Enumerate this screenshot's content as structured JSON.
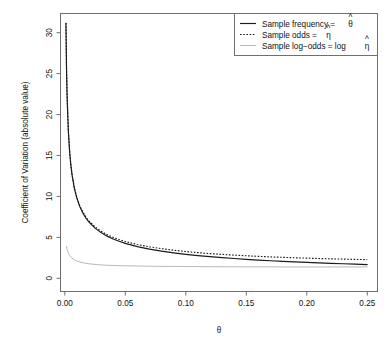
{
  "chart_data": {
    "type": "line",
    "title": "",
    "xlabel": "θ",
    "ylabel": "Coefficient of Variation (absolute value)",
    "xlim": [
      -0.0035,
      0.2585
    ],
    "ylim": [
      -1.6,
      32.8
    ],
    "xticks": [
      0.0,
      0.05,
      0.1,
      0.15,
      0.2,
      0.25
    ],
    "xticklabels": [
      "0.00",
      "0.05",
      "0.10",
      "0.15",
      "0.20",
      "0.25"
    ],
    "yticks": [
      0,
      5,
      10,
      15,
      20,
      25,
      30
    ],
    "yticklabels": [
      "0",
      "5",
      "10",
      "15",
      "20",
      "25",
      "30"
    ],
    "grid": false,
    "legend_position": "top-right",
    "series": [
      {
        "name": "Sample frequency = θ̂",
        "style": "solid",
        "color": "#1a1a1a",
        "x": [
          0.001,
          0.0015,
          0.002,
          0.003,
          0.004,
          0.005,
          0.006,
          0.008,
          0.01,
          0.0125,
          0.015,
          0.0175,
          0.02,
          0.025,
          0.03,
          0.035,
          0.04,
          0.045,
          0.05,
          0.06,
          0.07,
          0.08,
          0.09,
          0.1,
          0.11,
          0.12,
          0.13,
          0.14,
          0.15,
          0.16,
          0.17,
          0.18,
          0.19,
          0.2,
          0.21,
          0.22,
          0.23,
          0.24,
          0.25
        ],
        "y": [
          31.6,
          25.79,
          22.33,
          18.22,
          15.78,
          14.11,
          12.87,
          11.14,
          9.95,
          8.89,
          8.1,
          7.49,
          7.0,
          6.24,
          5.69,
          5.25,
          4.9,
          4.61,
          4.36,
          3.96,
          3.65,
          3.39,
          3.18,
          3.0,
          2.84,
          2.71,
          2.59,
          2.48,
          2.38,
          2.29,
          2.21,
          2.13,
          2.06,
          2.0,
          1.94,
          1.88,
          1.83,
          1.78,
          1.73
        ]
      },
      {
        "name": "Sample odds = η̂",
        "style": "dotted",
        "color": "#1a1a1a",
        "x": [
          0.001,
          0.0015,
          0.002,
          0.003,
          0.004,
          0.005,
          0.006,
          0.008,
          0.01,
          0.0125,
          0.015,
          0.0175,
          0.02,
          0.025,
          0.03,
          0.035,
          0.04,
          0.045,
          0.05,
          0.06,
          0.07,
          0.08,
          0.09,
          0.1,
          0.11,
          0.12,
          0.13,
          0.14,
          0.15,
          0.16,
          0.17,
          0.18,
          0.19,
          0.2,
          0.21,
          0.22,
          0.23,
          0.24,
          0.25
        ],
        "y": [
          31.63,
          25.83,
          22.38,
          18.28,
          15.84,
          14.18,
          12.94,
          11.23,
          10.05,
          8.99,
          8.22,
          7.61,
          7.14,
          6.4,
          5.86,
          5.44,
          5.1,
          4.83,
          4.59,
          4.21,
          3.93,
          3.7,
          3.51,
          3.35,
          3.21,
          3.09,
          2.99,
          2.9,
          2.82,
          2.75,
          2.68,
          2.63,
          2.57,
          2.53,
          2.48,
          2.44,
          2.41,
          2.37,
          2.34
        ]
      },
      {
        "name": "Sample log-odds = log η̂",
        "style": "solid-gray",
        "color": "#b9b9b9",
        "x": [
          0.0015,
          0.002,
          0.003,
          0.004,
          0.005,
          0.006,
          0.008,
          0.01,
          0.0125,
          0.015,
          0.0175,
          0.02,
          0.025,
          0.03,
          0.035,
          0.04,
          0.045,
          0.05,
          0.06,
          0.07,
          0.08,
          0.09,
          0.1,
          0.11,
          0.12,
          0.13,
          0.14,
          0.15,
          0.16,
          0.17,
          0.18,
          0.19,
          0.2,
          0.21,
          0.22,
          0.23,
          0.24,
          0.25
        ],
        "y": [
          3.98,
          3.62,
          3.16,
          2.87,
          2.67,
          2.52,
          2.3,
          2.18,
          2.04,
          1.96,
          1.89,
          1.83,
          1.75,
          1.69,
          1.65,
          1.62,
          1.6,
          1.58,
          1.55,
          1.53,
          1.51,
          1.5,
          1.49,
          1.48,
          1.47,
          1.46,
          1.46,
          1.45,
          1.45,
          1.45,
          1.44,
          1.44,
          1.44,
          1.44,
          1.44,
          1.44,
          1.44,
          1.44
        ]
      }
    ],
    "legend": [
      {
        "label_main": "Sample frequency = ",
        "symbol": "θ",
        "hat": true,
        "prefix": "",
        "style": "solid"
      },
      {
        "label_main": "Sample odds = ",
        "symbol": "η",
        "hat": true,
        "prefix": "",
        "style": "dotted"
      },
      {
        "label_main": "Sample log−odds = log ",
        "symbol": "η",
        "hat": true,
        "prefix": "",
        "style": "solid-gray"
      }
    ]
  },
  "colors": {
    "frame": "#6f6f6f",
    "curve_dark": "#1a1a1a",
    "curve_light": "#b9b9b9",
    "background": "#ffffff",
    "text": "#111111"
  }
}
